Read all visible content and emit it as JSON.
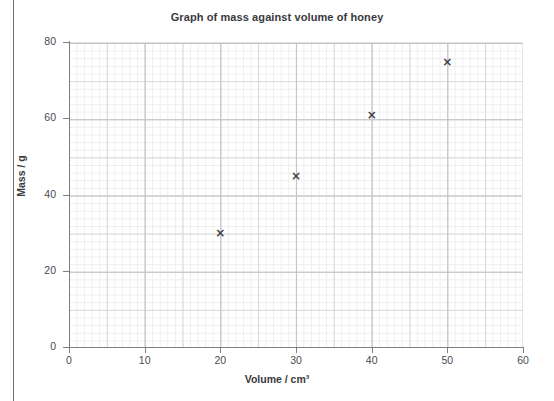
{
  "page": {
    "background": "#ffffff",
    "edge_rule_color": "#6e6e72"
  },
  "chart_data": {
    "type": "scatter",
    "title": "Graph of mass against volume of honey",
    "xlabel": "Volume / cm³",
    "ylabel": "Mass / g",
    "x": [
      20,
      30,
      40,
      50
    ],
    "values": [
      30,
      45,
      61,
      75
    ],
    "points": [
      {
        "x": 20,
        "y": 30
      },
      {
        "x": 30,
        "y": 45
      },
      {
        "x": 40,
        "y": 61
      },
      {
        "x": 50,
        "y": 75
      }
    ],
    "xlim": [
      0,
      60
    ],
    "ylim": [
      0,
      80
    ],
    "xticks": [
      "0",
      "10",
      "20",
      "30",
      "40",
      "50",
      "60"
    ],
    "xtick_values": [
      0,
      10,
      20,
      30,
      40,
      50,
      60
    ],
    "yticks": [
      "0",
      "20",
      "40",
      "60",
      "80"
    ],
    "ytick_values": [
      0,
      20,
      40,
      60,
      80
    ],
    "grid": true,
    "grid_minor_step_x": 2,
    "grid_minor_step_y": 2,
    "legend": null,
    "marker": "×",
    "marker_color": "#3f3f44",
    "grid_minor_color": "#eeeef1",
    "grid_major_color": "#d7d7dc",
    "axis_color": "#7d7d83"
  }
}
